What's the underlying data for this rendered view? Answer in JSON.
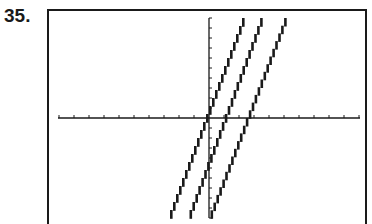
{
  "problem": {
    "number_label": "35."
  },
  "colors": {
    "ink": "#1a1a1a",
    "background": "#ffffff"
  },
  "chart_data": {
    "type": "line",
    "title": "",
    "xlabel": "",
    "ylabel": "",
    "xlim": [
      -10,
      10
    ],
    "ylim": [
      -10,
      10
    ],
    "xscl": 1,
    "yscl": 1,
    "grid": false,
    "legend": null,
    "render_style": "graphing-calculator pixel stair-step",
    "x_tick_count_each_side": 10,
    "y_tick_count_each_side": 10,
    "series": [
      {
        "name": "line-1",
        "approx_slope": 4,
        "x_intercept_approx": 0.0,
        "points": [
          [
            -2.6,
            -10
          ],
          [
            2.4,
            10
          ]
        ]
      },
      {
        "name": "line-2",
        "approx_slope": 4,
        "x_intercept_approx": 1.1,
        "points": [
          [
            -1.3,
            -10
          ],
          [
            3.6,
            10
          ]
        ]
      },
      {
        "name": "line-3",
        "approx_slope": 4,
        "x_intercept_approx": 2.6,
        "points": [
          [
            0.1,
            -10
          ],
          [
            5.2,
            10
          ]
        ]
      }
    ]
  },
  "layout_px": {
    "origin": [
      209,
      118
    ],
    "x_px_per_unit": 15,
    "y_px_per_unit": 10
  }
}
